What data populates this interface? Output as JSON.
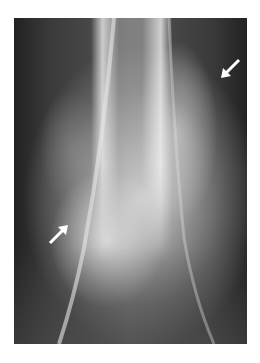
{
  "image": {
    "type": "radiograph",
    "description": "X-ray of distal long bone with two white arrows marking lesion borders",
    "arrows": [
      {
        "position": "upper-right",
        "direction": "down-left"
      },
      {
        "position": "lower-left",
        "direction": "up-right"
      }
    ]
  }
}
